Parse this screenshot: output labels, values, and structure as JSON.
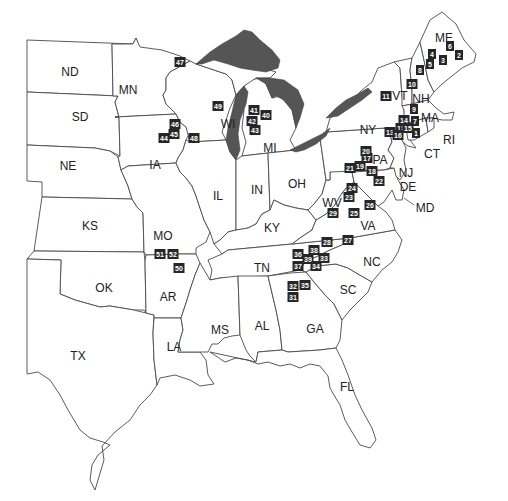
{
  "map": {
    "title": "Eastern United States site map",
    "colors": {
      "background": "#ffffff",
      "border": "#4a4a4a",
      "lakes": "#555555",
      "marker": "#262626",
      "marker_text": "#ffffff"
    },
    "state_labels": [
      {
        "id": "ND",
        "label": "ND"
      },
      {
        "id": "MN",
        "label": "MN"
      },
      {
        "id": "SD",
        "label": "SD"
      },
      {
        "id": "NE",
        "label": "NE"
      },
      {
        "id": "IA",
        "label": "IA"
      },
      {
        "id": "KS",
        "label": "KS"
      },
      {
        "id": "MO",
        "label": "MO"
      },
      {
        "id": "OK",
        "label": "OK"
      },
      {
        "id": "AR",
        "label": "AR"
      },
      {
        "id": "TX",
        "label": "TX"
      },
      {
        "id": "LA",
        "label": "LA"
      },
      {
        "id": "WI",
        "label": "WI"
      },
      {
        "id": "IL",
        "label": "IL"
      },
      {
        "id": "MI",
        "label": "MI"
      },
      {
        "id": "IN",
        "label": "IN"
      },
      {
        "id": "OH",
        "label": "OH"
      },
      {
        "id": "KY",
        "label": "KY"
      },
      {
        "id": "TN",
        "label": "TN"
      },
      {
        "id": "MS",
        "label": "MS"
      },
      {
        "id": "AL",
        "label": "AL"
      },
      {
        "id": "GA",
        "label": "GA"
      },
      {
        "id": "FL",
        "label": "FL"
      },
      {
        "id": "SC",
        "label": "SC"
      },
      {
        "id": "NC",
        "label": "NC"
      },
      {
        "id": "VA",
        "label": "VA"
      },
      {
        "id": "WV",
        "label": "WV"
      },
      {
        "id": "PA",
        "label": "PA"
      },
      {
        "id": "NY",
        "label": "NY"
      },
      {
        "id": "MD",
        "label": "MD"
      },
      {
        "id": "DE",
        "label": "DE"
      },
      {
        "id": "NJ",
        "label": "NJ"
      },
      {
        "id": "CT",
        "label": "CT"
      },
      {
        "id": "RI",
        "label": "RI"
      },
      {
        "id": "MA",
        "label": "MA"
      },
      {
        "id": "VT",
        "label": "VT"
      },
      {
        "id": "NH",
        "label": "NH"
      },
      {
        "id": "ME",
        "label": "ME"
      }
    ],
    "sites": [
      {
        "id": "1",
        "state": "MA"
      },
      {
        "id": "2",
        "state": "ME"
      },
      {
        "id": "3",
        "state": "ME"
      },
      {
        "id": "4",
        "state": "ME"
      },
      {
        "id": "5",
        "state": "ME"
      },
      {
        "id": "6",
        "state": "ME"
      },
      {
        "id": "7",
        "state": "MA"
      },
      {
        "id": "8",
        "state": "ME"
      },
      {
        "id": "9",
        "state": "MA"
      },
      {
        "id": "10",
        "state": "VT"
      },
      {
        "id": "11",
        "state": "NY"
      },
      {
        "id": "12",
        "state": "NY"
      },
      {
        "id": "13",
        "state": "NY"
      },
      {
        "id": "14",
        "state": "NY"
      },
      {
        "id": "15",
        "state": "NY"
      },
      {
        "id": "16",
        "state": "NY"
      },
      {
        "id": "17",
        "state": "PA"
      },
      {
        "id": "18",
        "state": "PA"
      },
      {
        "id": "19",
        "state": "PA"
      },
      {
        "id": "20",
        "state": "PA"
      },
      {
        "id": "21",
        "state": "PA"
      },
      {
        "id": "22",
        "state": "PA"
      },
      {
        "id": "23",
        "state": "WV"
      },
      {
        "id": "24",
        "state": "WV"
      },
      {
        "id": "25",
        "state": "VA"
      },
      {
        "id": "26",
        "state": "VA"
      },
      {
        "id": "27",
        "state": "VA"
      },
      {
        "id": "28",
        "state": "VA"
      },
      {
        "id": "29",
        "state": "WV"
      },
      {
        "id": "31",
        "state": "GA"
      },
      {
        "id": "32",
        "state": "GA"
      },
      {
        "id": "33",
        "state": "NC"
      },
      {
        "id": "34",
        "state": "NC"
      },
      {
        "id": "35",
        "state": "SC"
      },
      {
        "id": "36",
        "state": "TN"
      },
      {
        "id": "37",
        "state": "TN"
      },
      {
        "id": "38",
        "state": "NC"
      },
      {
        "id": "39",
        "state": "NC"
      },
      {
        "id": "40",
        "state": "MI"
      },
      {
        "id": "41",
        "state": "MI"
      },
      {
        "id": "42",
        "state": "MI"
      },
      {
        "id": "43",
        "state": "MI"
      },
      {
        "id": "44",
        "state": "MN"
      },
      {
        "id": "45",
        "state": "WI"
      },
      {
        "id": "46",
        "state": "WI"
      },
      {
        "id": "47",
        "state": "WI"
      },
      {
        "id": "48",
        "state": "WI"
      },
      {
        "id": "49",
        "state": "WI"
      },
      {
        "id": "50",
        "state": "AR"
      },
      {
        "id": "51",
        "state": "MO"
      },
      {
        "id": "52",
        "state": "MO"
      }
    ]
  }
}
